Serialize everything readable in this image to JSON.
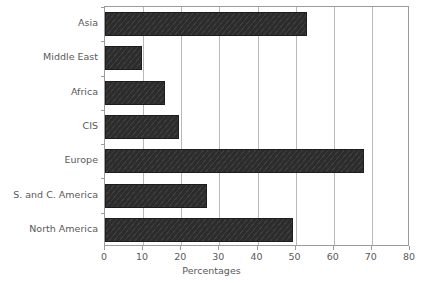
{
  "chart_data": {
    "type": "bar",
    "orientation": "horizontal",
    "title": "",
    "xlabel": "Percentages",
    "ylabel": "",
    "xlim": [
      0,
      80
    ],
    "xticks": [
      0,
      10,
      20,
      30,
      40,
      50,
      60,
      70,
      80
    ],
    "grid": "vertical",
    "legend": "none",
    "categories": [
      "Asia",
      "Middle East",
      "Africa",
      "CIS",
      "Europe",
      "S. and C. America",
      "North America"
    ],
    "values": [
      53,
      9.7,
      15.8,
      19.4,
      68,
      26.8,
      49.4
    ],
    "series": [
      {
        "name": "Percentages",
        "values": [
          53,
          9.7,
          15.8,
          19.4,
          68,
          26.8,
          49.4
        ]
      }
    ],
    "colors": {
      "bar_fill": "#2c2c2c",
      "bar_edge": "#1d1d1d",
      "gridline": "#b9b9b9",
      "axis": "#9b9b9b",
      "text": "#595959",
      "background": "#ffffff"
    }
  }
}
